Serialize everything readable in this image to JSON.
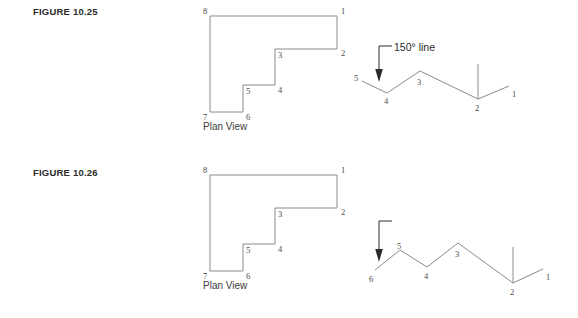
{
  "page": {
    "background": "#ffffff",
    "line_color": "#8a8a8a",
    "text_color": "#2b2b2b"
  },
  "figures": [
    {
      "label": "FIGURE 10.25",
      "plan": {
        "caption": "Plan View",
        "vertex_labels": [
          "1",
          "2",
          "3",
          "4",
          "5",
          "6",
          "7",
          "8"
        ],
        "points": "337,16 337,49 275,49 275,85 243,85 243,112 210,112 210,16"
      },
      "traverse": {
        "annotation": "150° line",
        "vertex_labels": [
          "1",
          "2",
          "3",
          "4",
          "5"
        ],
        "polyline": "362,81 387,93 420,71 478,99 509,86",
        "vertical_tick": "478,99 478,64"
      }
    },
    {
      "label": "FIGURE 10.26",
      "plan": {
        "caption": "Plan View",
        "vertex_labels": [
          "1",
          "2",
          "3",
          "4",
          "5",
          "6",
          "7",
          "8"
        ],
        "points": "337,16 337,49 275,49 275,85 243,85 243,112 210,112 210,16"
      },
      "traverse": {
        "annotation": "210° line",
        "vertex_labels": [
          "1",
          "2",
          "3",
          "4",
          "5",
          "6"
        ],
        "polyline": "375,111 400,91 427,108 458,84 513,124 543,110",
        "vertical_tick": "513,124 513,88"
      }
    }
  ]
}
